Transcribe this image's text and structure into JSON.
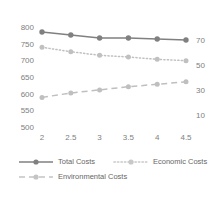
{
  "chart_data": {
    "type": "line",
    "title": "",
    "subtitle": "",
    "xlabel": "",
    "ylabel": "",
    "y2label": "",
    "x": [
      2,
      2.5,
      3,
      3.5,
      4,
      4.5
    ],
    "xtick_labels": [
      "2",
      "2.5",
      "3",
      "3.5",
      "4",
      "4.5"
    ],
    "ylim": [
      500,
      800
    ],
    "ytick_labels": [
      "800",
      "750",
      "700",
      "650",
      "600",
      "550",
      "500"
    ],
    "ytick_values": [
      800,
      750,
      700,
      650,
      600,
      550,
      500
    ],
    "y2lim": [
      0,
      80
    ],
    "y2tick_labels": [
      "70",
      "50",
      "30",
      "10"
    ],
    "y2tick_values": [
      70,
      50,
      30,
      10
    ],
    "grid": false,
    "legend_position": "bottom",
    "series": [
      {
        "name": "Total Costs",
        "axis": "left",
        "style": "solid",
        "color": "#808080",
        "marker": "circle",
        "values": [
          788,
          779,
          770,
          770,
          767,
          764
        ]
      },
      {
        "name": "Economic Costs",
        "axis": "left",
        "style": "dotted",
        "color": "#c0c0c0",
        "marker": "circle",
        "values": [
          742,
          729,
          718,
          713,
          706,
          702
        ]
      },
      {
        "name": "Environmental Costs",
        "axis": "right",
        "style": "dashed",
        "color": "#bfbfbf",
        "marker": "circle",
        "values": [
          24.5,
          28.0,
          30.5,
          33.0,
          35.0,
          37.0
        ]
      }
    ]
  },
  "legend": {
    "items": [
      {
        "label": "Total Costs"
      },
      {
        "label": "Economic Costs"
      },
      {
        "label": "Environmental Costs"
      }
    ]
  }
}
